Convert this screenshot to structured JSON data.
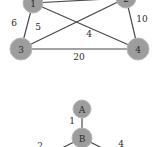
{
  "graph1": {
    "nodes": [
      {
        "id": "1",
        "label": "1",
        "x": 33,
        "y": 3
      },
      {
        "id": "2",
        "label": "2",
        "x": 126,
        "y": -2
      },
      {
        "id": "3",
        "label": "3",
        "x": 21,
        "y": 49
      },
      {
        "id": "4",
        "label": "4",
        "x": 138,
        "y": 49
      }
    ],
    "edges": [
      {
        "from": "1",
        "to": "2",
        "weight": ""
      },
      {
        "from": "1",
        "to": "3",
        "weight": "6"
      },
      {
        "from": "3",
        "to": "2",
        "weight": "5"
      },
      {
        "from": "1",
        "to": "4",
        "weight": "4"
      },
      {
        "from": "2",
        "to": "4",
        "weight": "10"
      },
      {
        "from": "3",
        "to": "4",
        "weight": "20"
      }
    ],
    "edge_labels": {
      "e13": "6",
      "e32": "5",
      "e14": "4",
      "e24": "10",
      "e34": "20"
    }
  },
  "graph2": {
    "nodes": [
      {
        "id": "A",
        "label": "A"
      },
      {
        "id": "B",
        "label": "B"
      }
    ],
    "edge_labels": {
      "eAB": "1",
      "eB_left": "2",
      "eB_right": "4"
    }
  }
}
